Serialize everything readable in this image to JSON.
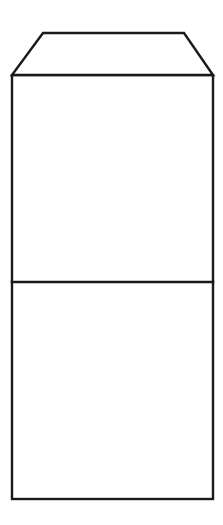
{
  "figure": {
    "background_color": "#ffffff",
    "line_color": "#1a1a1a",
    "line_width_px": 2.5,
    "canvas": {
      "width": 223,
      "height": 525
    },
    "caption": "",
    "parts": [
      {
        "name": "top-flap",
        "shape": "trapezoid",
        "label": "",
        "points": "43,33 184,33 213,75 12,75",
        "fill": "#ffffff"
      },
      {
        "name": "envelope-body",
        "shape": "rectangle",
        "label": "",
        "x": 12,
        "y": 75,
        "width": 201,
        "height": 424,
        "fill": "#ffffff"
      },
      {
        "name": "upper-panel",
        "shape": "region",
        "label": "",
        "x": 12,
        "y": 75,
        "width": 201,
        "height": 207
      },
      {
        "name": "lower-panel",
        "shape": "region",
        "label": "",
        "x": 12,
        "y": 282,
        "width": 201,
        "height": 217
      },
      {
        "name": "fold-line",
        "shape": "line",
        "label": "",
        "x1": 12,
        "y1": 282,
        "x2": 213,
        "y2": 282
      }
    ]
  }
}
